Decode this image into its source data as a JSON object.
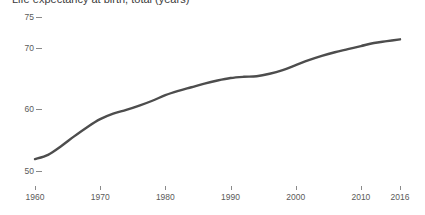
{
  "chart_data": {
    "type": "line",
    "title": "Life expectancy at birth, total (years)",
    "subtitle": "",
    "xlabel": "",
    "ylabel": "",
    "xlim": [
      1960,
      2016
    ],
    "ylim": [
      48.5,
      76.5
    ],
    "grid": false,
    "legend": "none",
    "line_color": "#4d4d4d",
    "line_width": 2.4,
    "x_ticks": [
      1960,
      1970,
      1980,
      1990,
      2000,
      2010,
      2016
    ],
    "x_tick_labels": [
      "1960",
      "1970",
      "1980",
      "1990",
      "2000",
      "2010",
      "2016"
    ],
    "y_ticks": [
      50,
      60,
      70,
      75
    ],
    "y_tick_labels": [
      "50",
      "60",
      "70",
      "75"
    ],
    "series": [
      {
        "name": "Life expectancy",
        "x": [
          1960,
          1962,
          1964,
          1966,
          1968,
          1970,
          1972,
          1974,
          1976,
          1978,
          1980,
          1982,
          1984,
          1986,
          1988,
          1990,
          1992,
          1994,
          1996,
          1998,
          2000,
          2002,
          2004,
          2006,
          2008,
          2010,
          2012,
          2014,
          2016
        ],
        "values": [
          51.9,
          52.6,
          54.0,
          55.6,
          57.1,
          58.4,
          59.3,
          59.9,
          60.6,
          61.4,
          62.3,
          63.0,
          63.6,
          64.2,
          64.7,
          65.1,
          65.3,
          65.4,
          65.8,
          66.4,
          67.2,
          68.0,
          68.7,
          69.3,
          69.8,
          70.3,
          70.8,
          71.1,
          71.4
        ]
      }
    ]
  },
  "axis": {
    "y_axis_name": "y-axis",
    "x_axis_name": "x-axis"
  }
}
